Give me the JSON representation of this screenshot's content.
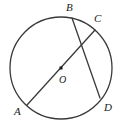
{
  "figure": {
    "type": "circle-geometry-diagram",
    "background_color": "#ffffff",
    "stroke_color": "#3a3a3a",
    "label_color": "#1a1a1a",
    "width": 120,
    "height": 126,
    "circle": {
      "center_label": "O",
      "center_x": 61,
      "center_y": 68,
      "radius": 51,
      "stroke_width": 1.3
    },
    "center_dot": {
      "x": 61,
      "y": 68,
      "size": 3
    },
    "labels": {
      "a": "A",
      "b": "B",
      "c": "C",
      "d": "D",
      "o": "O"
    },
    "points": [
      {
        "name": "A",
        "label": "A",
        "x": 27,
        "y": 105
      },
      {
        "name": "B",
        "label": "B",
        "x": 72,
        "y": 18
      },
      {
        "name": "C",
        "label": "C",
        "x": 95,
        "y": 30
      },
      {
        "name": "D",
        "label": "D",
        "x": 100,
        "y": 98
      },
      {
        "name": "O",
        "label": "O",
        "x": 61,
        "y": 68
      }
    ],
    "segments": [
      {
        "name": "diameter-AC",
        "from": "A",
        "to": "C",
        "x1": 27,
        "y1": 105,
        "x2": 95,
        "y2": 30,
        "kind": "diameter",
        "passes_through_center": true
      },
      {
        "name": "chord-BD",
        "from": "B",
        "to": "D",
        "x1": 72,
        "y1": 18,
        "x2": 100,
        "y2": 98,
        "kind": "chord",
        "passes_through_center": false
      }
    ],
    "intersection": {
      "x": 81,
      "y": 52
    }
  }
}
